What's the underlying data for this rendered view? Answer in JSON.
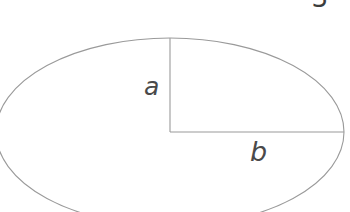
{
  "figure": {
    "number": "3",
    "background_color": "#ffffff",
    "stroke_color": "#9a9a9a",
    "label_color": "#4a4a4a",
    "width": 350,
    "height": 212
  },
  "diagram": {
    "type": "ellipse-semi-axes",
    "ellipse": {
      "center_x": 170,
      "center_y": 132,
      "radius_x": 174,
      "radius_y": 94
    },
    "semi_minor_axis": {
      "label": "a",
      "orientation": "vertical",
      "from_x": 170,
      "from_y": 132,
      "to_x": 170,
      "to_y": 38
    },
    "semi_major_axis": {
      "label": "b",
      "orientation": "horizontal",
      "from_x": 170,
      "from_y": 132,
      "to_x": 344,
      "to_y": 132
    }
  }
}
